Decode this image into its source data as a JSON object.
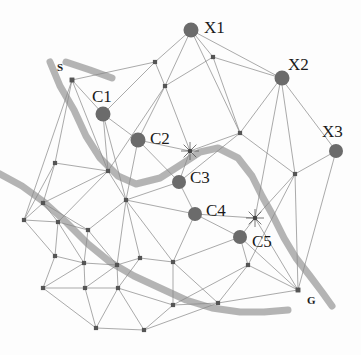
{
  "figure": {
    "type": "graph-diagram",
    "title": "",
    "background_color": "#fdfdfd",
    "mesh_edge_color": "#8a8a8a",
    "mesh_node_color": "#555555",
    "big_node_color": "#6b6b6b",
    "path_color": "#b0b0b0",
    "label_color": "#1a1a1a"
  },
  "labels": {
    "start": "S",
    "goal": "G",
    "x1": "X1",
    "x2": "X2",
    "x3": "X3",
    "c1": "C1",
    "c2": "C2",
    "c3": "C3",
    "c4": "C4",
    "c5": "C5"
  },
  "chart_data": {
    "type": "scatter",
    "title": "",
    "xlabel": "",
    "ylabel": "",
    "xlim": [
      0,
      361
    ],
    "ylim": [
      0,
      355
    ],
    "grid": false,
    "legend": "none",
    "big_nodes": [
      {
        "id": "X1",
        "label": "X1",
        "x": 191,
        "y": 30,
        "r": 7.5,
        "label_x": 204,
        "label_y": 19
      },
      {
        "id": "X2",
        "label": "X2",
        "x": 282,
        "y": 78,
        "r": 7.5,
        "label_x": 288,
        "label_y": 56
      },
      {
        "id": "X3",
        "label": "X3",
        "x": 336,
        "y": 151,
        "r": 7.0,
        "label_x": 322,
        "label_y": 123
      },
      {
        "id": "C1",
        "label": "C1",
        "x": 103,
        "y": 114,
        "r": 7.5,
        "label_x": 92,
        "label_y": 88
      },
      {
        "id": "C2",
        "label": "C2",
        "x": 138,
        "y": 140,
        "r": 7.5,
        "label_x": 150,
        "label_y": 130
      },
      {
        "id": "C3",
        "label": "C3",
        "x": 179,
        "y": 182,
        "r": 7.0,
        "label_x": 190,
        "label_y": 169
      },
      {
        "id": "C4",
        "label": "C4",
        "x": 195,
        "y": 214,
        "r": 7.0,
        "label_x": 206,
        "label_y": 202
      },
      {
        "id": "C5",
        "label": "C5",
        "x": 240,
        "y": 237,
        "r": 7.0,
        "label_x": 252,
        "label_y": 233
      }
    ],
    "terminal_nodes": [
      {
        "id": "S",
        "label": "S",
        "x": 72,
        "y": 80,
        "label_x": 57,
        "label_y": 62
      },
      {
        "id": "G",
        "label": "G",
        "x": 298,
        "y": 290,
        "label_x": 307,
        "label_y": 295
      }
    ],
    "mesh_nodes": [
      {
        "id": "n0",
        "x": 72,
        "y": 80
      },
      {
        "id": "n1",
        "x": 155,
        "y": 62
      },
      {
        "id": "n2",
        "x": 213,
        "y": 57
      },
      {
        "id": "n3",
        "x": 165,
        "y": 86
      },
      {
        "id": "n4",
        "x": 240,
        "y": 133
      },
      {
        "id": "n5",
        "x": 190,
        "y": 151
      },
      {
        "id": "n6",
        "x": 295,
        "y": 174
      },
      {
        "id": "n7",
        "x": 255,
        "y": 218
      },
      {
        "id": "n8",
        "x": 55,
        "y": 163
      },
      {
        "id": "n9",
        "x": 108,
        "y": 171
      },
      {
        "id": "n10",
        "x": 43,
        "y": 203
      },
      {
        "id": "n11",
        "x": 24,
        "y": 220
      },
      {
        "id": "n12",
        "x": 58,
        "y": 222
      },
      {
        "id": "n13",
        "x": 88,
        "y": 230
      },
      {
        "id": "n14",
        "x": 126,
        "y": 200
      },
      {
        "id": "n15",
        "x": 55,
        "y": 256
      },
      {
        "id": "n16",
        "x": 84,
        "y": 263
      },
      {
        "id": "n17",
        "x": 117,
        "y": 265
      },
      {
        "id": "n18",
        "x": 140,
        "y": 258
      },
      {
        "id": "n19",
        "x": 173,
        "y": 262
      },
      {
        "id": "n20",
        "x": 43,
        "y": 288
      },
      {
        "id": "n21",
        "x": 85,
        "y": 288
      },
      {
        "id": "n22",
        "x": 118,
        "y": 288
      },
      {
        "id": "n23",
        "x": 96,
        "y": 328
      },
      {
        "id": "n24",
        "x": 144,
        "y": 330
      },
      {
        "id": "n25",
        "x": 218,
        "y": 303
      },
      {
        "id": "n26",
        "x": 173,
        "y": 305
      },
      {
        "id": "n27",
        "x": 248,
        "y": 265
      },
      {
        "id": "n28",
        "x": 298,
        "y": 290
      },
      {
        "id": "n29",
        "x": 281,
        "y": 78
      },
      {
        "id": "n30",
        "x": 191,
        "y": 30
      },
      {
        "id": "n31",
        "x": 336,
        "y": 151
      },
      {
        "id": "n32",
        "x": 103,
        "y": 114
      },
      {
        "id": "n33",
        "x": 138,
        "y": 140
      },
      {
        "id": "n34",
        "x": 179,
        "y": 182
      },
      {
        "id": "n35",
        "x": 195,
        "y": 214
      },
      {
        "id": "n36",
        "x": 240,
        "y": 237
      }
    ],
    "edges": [
      [
        "n0",
        "n1"
      ],
      [
        "n0",
        "n32"
      ],
      [
        "n0",
        "n8"
      ],
      [
        "n0",
        "n9"
      ],
      [
        "n0",
        "n11"
      ],
      [
        "n1",
        "n30"
      ],
      [
        "n1",
        "n3"
      ],
      [
        "n1",
        "n32"
      ],
      [
        "n30",
        "n2"
      ],
      [
        "n30",
        "n3"
      ],
      [
        "n30",
        "n29"
      ],
      [
        "n30",
        "n4"
      ],
      [
        "n2",
        "n29"
      ],
      [
        "n2",
        "n4"
      ],
      [
        "n2",
        "n3"
      ],
      [
        "n3",
        "n33"
      ],
      [
        "n3",
        "n5"
      ],
      [
        "n3",
        "n9"
      ],
      [
        "n29",
        "n4"
      ],
      [
        "n29",
        "n6"
      ],
      [
        "n29",
        "n7"
      ],
      [
        "n29",
        "n31"
      ],
      [
        "n4",
        "n5"
      ],
      [
        "n4",
        "n6"
      ],
      [
        "n4",
        "n34"
      ],
      [
        "n5",
        "n33"
      ],
      [
        "n5",
        "n34"
      ],
      [
        "n6",
        "n31"
      ],
      [
        "n6",
        "n7"
      ],
      [
        "n6",
        "n28"
      ],
      [
        "n6",
        "n27"
      ],
      [
        "n31",
        "n28"
      ],
      [
        "n7",
        "n35"
      ],
      [
        "n7",
        "n36"
      ],
      [
        "n7",
        "n28"
      ],
      [
        "n32",
        "n33"
      ],
      [
        "n32",
        "n9"
      ],
      [
        "n32",
        "n14"
      ],
      [
        "n33",
        "n34"
      ],
      [
        "n33",
        "n14"
      ],
      [
        "n34",
        "n35"
      ],
      [
        "n34",
        "n14"
      ],
      [
        "n35",
        "n36"
      ],
      [
        "n35",
        "n14"
      ],
      [
        "n35",
        "n19"
      ],
      [
        "n36",
        "n28"
      ],
      [
        "n36",
        "n27"
      ],
      [
        "n36",
        "n19"
      ],
      [
        "n8",
        "n9"
      ],
      [
        "n8",
        "n10"
      ],
      [
        "n8",
        "n11"
      ],
      [
        "n9",
        "n14"
      ],
      [
        "n9",
        "n12"
      ],
      [
        "n9",
        "n10"
      ],
      [
        "n10",
        "n11"
      ],
      [
        "n10",
        "n12"
      ],
      [
        "n10",
        "n13"
      ],
      [
        "n11",
        "n12"
      ],
      [
        "n11",
        "n15"
      ],
      [
        "n12",
        "n13"
      ],
      [
        "n12",
        "n16"
      ],
      [
        "n12",
        "n15"
      ],
      [
        "n13",
        "n14"
      ],
      [
        "n13",
        "n17"
      ],
      [
        "n13",
        "n16"
      ],
      [
        "n14",
        "n18"
      ],
      [
        "n14",
        "n17"
      ],
      [
        "n14",
        "n19"
      ],
      [
        "n15",
        "n16"
      ],
      [
        "n15",
        "n20"
      ],
      [
        "n16",
        "n17"
      ],
      [
        "n16",
        "n21"
      ],
      [
        "n16",
        "n20"
      ],
      [
        "n17",
        "n18"
      ],
      [
        "n17",
        "n21"
      ],
      [
        "n17",
        "n22"
      ],
      [
        "n18",
        "n19"
      ],
      [
        "n18",
        "n22"
      ],
      [
        "n19",
        "n26"
      ],
      [
        "n19",
        "n25"
      ],
      [
        "n20",
        "n21"
      ],
      [
        "n20",
        "n23"
      ],
      [
        "n21",
        "n22"
      ],
      [
        "n21",
        "n23"
      ],
      [
        "n22",
        "n23"
      ],
      [
        "n22",
        "n26"
      ],
      [
        "n22",
        "n24"
      ],
      [
        "n23",
        "n24"
      ],
      [
        "n24",
        "n26"
      ],
      [
        "n24",
        "n25"
      ],
      [
        "n26",
        "n25"
      ],
      [
        "n26",
        "n27"
      ],
      [
        "n25",
        "n28"
      ],
      [
        "n25",
        "n27"
      ],
      [
        "n27",
        "n28"
      ]
    ],
    "paths": [
      {
        "id": "path-main",
        "color": "#b0b0b0",
        "width": 7,
        "points": [
          [
            50,
            62
          ],
          [
            60,
            86
          ],
          [
            74,
            110
          ],
          [
            86,
            136
          ],
          [
            100,
            158
          ],
          [
            118,
            176
          ],
          [
            136,
            184
          ],
          [
            160,
            178
          ],
          [
            182,
            164
          ],
          [
            200,
            152
          ],
          [
            218,
            148
          ],
          [
            238,
            158
          ],
          [
            252,
            176
          ],
          [
            262,
            196
          ],
          [
            272,
            214
          ],
          [
            284,
            238
          ],
          [
            296,
            258
          ],
          [
            310,
            276
          ],
          [
            322,
            292
          ],
          [
            332,
            306
          ]
        ]
      },
      {
        "id": "path-branch",
        "color": "#b0b0b0",
        "width": 7,
        "points": [
          [
            66,
            62
          ],
          [
            90,
            70
          ],
          [
            112,
            78
          ]
        ]
      },
      {
        "id": "path-lower",
        "color": "#b0b0b0",
        "width": 7,
        "points": [
          [
            0,
            174
          ],
          [
            22,
            186
          ],
          [
            44,
            202
          ],
          [
            66,
            222
          ],
          [
            88,
            244
          ],
          [
            110,
            262
          ],
          [
            134,
            276
          ],
          [
            160,
            288
          ],
          [
            186,
            300
          ],
          [
            212,
            308
          ],
          [
            240,
            312
          ],
          [
            264,
            312
          ],
          [
            288,
            310
          ]
        ]
      }
    ],
    "star_markers": [
      {
        "id": "star-1",
        "x": 190,
        "y": 151
      },
      {
        "id": "star-2",
        "x": 255,
        "y": 218
      }
    ]
  }
}
